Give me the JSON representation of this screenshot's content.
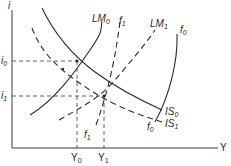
{
  "diagram": {
    "type": "IS-LM economic diagram",
    "axes": {
      "y_label": "i",
      "x_label": "Y"
    },
    "curves": {
      "LM0": {
        "label": "LM",
        "sub": "0",
        "style": "solid"
      },
      "LM1": {
        "label": "LM",
        "sub": "1",
        "style": "dashed"
      },
      "IS0": {
        "label": "IS",
        "sub": "0",
        "style": "solid"
      },
      "IS1": {
        "label": "IS",
        "sub": "1",
        "style": "dashed"
      },
      "f0": {
        "label": "f",
        "sub": "0",
        "style": "solid"
      },
      "f1": {
        "label": "f",
        "sub": "1",
        "style": "dashed"
      }
    },
    "f0_bottom": {
      "label": "f",
      "sub": "0"
    },
    "f1_bottom": {
      "label": "f",
      "sub": "1"
    },
    "ticks": {
      "i0": {
        "label": "i",
        "sub": "0"
      },
      "i1": {
        "label": "i",
        "sub": "1"
      },
      "Y0": {
        "label": "Y",
        "sub": "0"
      },
      "Y1": {
        "label": "Y",
        "sub": "1"
      }
    },
    "equilibria": [
      {
        "name": "initial",
        "interest": "i0",
        "income": "Y0"
      },
      {
        "name": "new",
        "interest": "i1",
        "income": "Y1"
      }
    ]
  }
}
